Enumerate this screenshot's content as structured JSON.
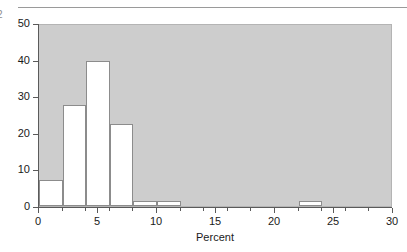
{
  "page": {
    "number": "2",
    "rule": "horizontal-rule"
  },
  "chart_data": {
    "type": "bar",
    "title": "",
    "subtitle": "",
    "xlabel": "Percent",
    "ylabel": "",
    "xlim": [
      0,
      30
    ],
    "ylim": [
      0,
      50
    ],
    "grid": false,
    "legend": null,
    "bin_width": 2,
    "categories": [
      "0-2",
      "2-4",
      "4-6",
      "6-8",
      "8-10",
      "10-12",
      "12-14",
      "14-16",
      "16-18",
      "18-20",
      "20-22",
      "22-24",
      "24-26",
      "26-28",
      "28-30"
    ],
    "bin_edges": [
      0,
      2,
      4,
      6,
      8,
      10,
      12,
      14,
      16,
      18,
      20,
      22,
      24,
      26,
      28,
      30
    ],
    "values": [
      7,
      27.5,
      39.5,
      22.5,
      1.5,
      1.5,
      0,
      0,
      0,
      0,
      0,
      1.5,
      0,
      0,
      0
    ],
    "bars": [
      {
        "x0": 0,
        "x1": 2,
        "value": 7
      },
      {
        "x0": 2,
        "x1": 4,
        "value": 27.5
      },
      {
        "x0": 4,
        "x1": 6,
        "value": 39.5
      },
      {
        "x0": 6,
        "x1": 8,
        "value": 22.5
      },
      {
        "x0": 8,
        "x1": 10,
        "value": 1.5
      },
      {
        "x0": 10,
        "x1": 12,
        "value": 1.5
      },
      {
        "x0": 22,
        "x1": 24,
        "value": 1.5
      }
    ],
    "x_ticks_major": [
      0,
      5,
      10,
      15,
      20,
      25,
      30
    ],
    "x_tick_labels": [
      "0",
      "5",
      "10",
      "15",
      "20",
      "25",
      "30"
    ],
    "x_ticks_minor": [
      2,
      4,
      6,
      8,
      12,
      14,
      16,
      18,
      22,
      24,
      26,
      28
    ],
    "y_ticks": [
      0,
      10,
      20,
      30,
      40,
      50
    ],
    "y_tick_labels": [
      "0",
      "10",
      "20",
      "30",
      "40",
      "50"
    ],
    "colors": {
      "plot_background": "#cdcdcd",
      "bar_fill": "#ffffff",
      "bar_stroke": "#8c8c8c",
      "axis": "#5a5a5a",
      "text": "#1a1a1a"
    }
  }
}
